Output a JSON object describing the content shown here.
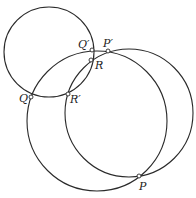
{
  "diagram": {
    "stroke_color": "#2a2a2a",
    "background": "#ffffff",
    "circles": [
      {
        "name": "small-circle",
        "cx": 49,
        "cy": 52,
        "r": 45
      },
      {
        "name": "left-large-circle",
        "cx": 97,
        "cy": 121,
        "r": 70
      },
      {
        "name": "right-large-circle",
        "cx": 129,
        "cy": 113,
        "r": 64
      }
    ],
    "points": [
      {
        "id": "Q_prime",
        "label": "Q′",
        "x": 92,
        "y": 50,
        "lx": 78,
        "ly": 48
      },
      {
        "id": "P_prime",
        "label": "P′",
        "x": 108,
        "y": 51,
        "lx": 103,
        "ly": 47
      },
      {
        "id": "R",
        "label": "R",
        "x": 91,
        "y": 60,
        "lx": 95,
        "ly": 69
      },
      {
        "id": "Q",
        "label": "Q",
        "x": 31,
        "y": 97,
        "lx": 19,
        "ly": 102
      },
      {
        "id": "R_prime",
        "label": "R′",
        "x": 68,
        "y": 94,
        "lx": 70,
        "ly": 103
      },
      {
        "id": "P",
        "label": "P",
        "x": 139,
        "y": 176,
        "lx": 139,
        "ly": 190
      }
    ]
  }
}
